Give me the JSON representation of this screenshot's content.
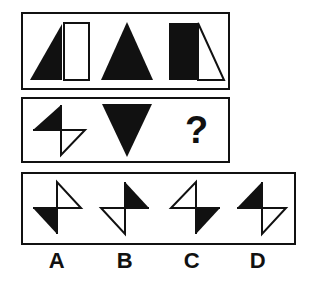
{
  "puzzle": {
    "type": "matrix-reasoning",
    "title": "Figural analogy puzzle",
    "colors": {
      "ink": "#111111",
      "fill": "#111111",
      "paper": "#ffffff"
    },
    "problem_row": {
      "name": "problem-row",
      "cells": [
        {
          "id": "P1",
          "description": "Solid black right triangle with apex at top-right beside an open white rectangle",
          "shapes": [
            "filled-triangle",
            "outlined-rectangle"
          ]
        },
        {
          "id": "P2",
          "description": "Solid black isosceles triangle pointing up",
          "shapes": [
            "filled-triangle-up"
          ]
        },
        {
          "id": "P3",
          "description": "Solid black rectangle beside an open white right triangle with apex at top-left",
          "shapes": [
            "filled-rectangle",
            "outlined-triangle"
          ]
        }
      ]
    },
    "sequence_row": {
      "name": "sequence-row",
      "cells": [
        {
          "id": "S1",
          "description": "Pinwheel: filled triangle upper-left, open triangle lower-right",
          "shapes": [
            "filled-triangle",
            "outlined-triangle"
          ]
        },
        {
          "id": "S2",
          "description": "Solid black isosceles triangle pointing down",
          "shapes": [
            "filled-triangle-down"
          ]
        },
        {
          "id": "S3",
          "description": "Missing element",
          "shapes": [
            "question-mark"
          ],
          "glyph": "?"
        }
      ]
    },
    "options_row": {
      "name": "answer-options-row",
      "options": [
        {
          "label": "A",
          "description": "Open triangle upper-right, filled triangle lower-left"
        },
        {
          "label": "B",
          "description": "Filled triangle upper-right, open triangle lower-left"
        },
        {
          "label": "C",
          "description": "Open triangle upper-left, filled triangle lower-right"
        },
        {
          "label": "D",
          "description": "Filled triangle upper-left, open triangle lower-right"
        }
      ]
    }
  }
}
